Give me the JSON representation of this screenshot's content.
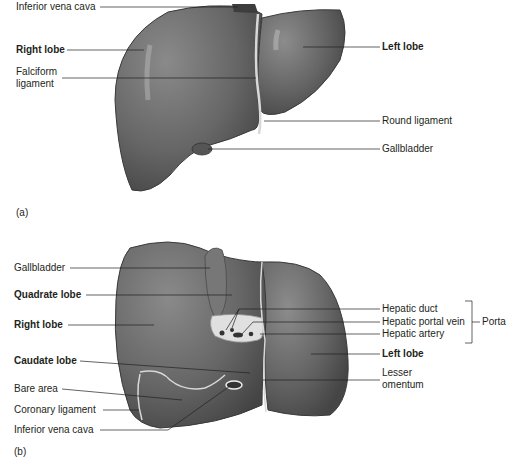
{
  "figure_a": {
    "panel_label": "(a)",
    "labels": {
      "inferior_vena_cava": "Inferior vena cava",
      "right_lobe": "Right lobe",
      "falciform_1": "Falciform",
      "falciform_2": "ligament",
      "left_lobe": "Left lobe",
      "round_ligament": "Round ligament",
      "gallbladder": "Gallbladder"
    }
  },
  "figure_b": {
    "panel_label": "(b)",
    "labels": {
      "gallbladder": "Gallbladder",
      "quadrate_lobe": "Quadrate lobe",
      "right_lobe": "Right lobe",
      "caudate_lobe": "Caudate lobe",
      "bare_area": "Bare area",
      "coronary_ligament": "Coronary ligament",
      "inferior_vena_cava": "Inferior vena cava",
      "hepatic_duct": "Hepatic duct",
      "hepatic_portal_vein": "Hepatic portal vein",
      "hepatic_artery": "Hepatic artery",
      "porta": "Porta",
      "left_lobe": "Left lobe",
      "lesser_omentum_1": "Lesser",
      "lesser_omentum_2": "omentum"
    }
  },
  "colors": {
    "organ": "#6e6e6e",
    "organ_dark": "#4a4a4a",
    "highlight": "#a8a8a8",
    "leader_line": "#231f20"
  }
}
